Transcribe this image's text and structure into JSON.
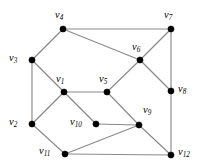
{
  "figure": {
    "background_color": "#ffffff",
    "edge_color": "#8a8a8a",
    "vertex_color": "#000000",
    "label_color": "#000000"
  },
  "graph": {
    "type": "undirected-graph",
    "vertex_count": 12,
    "edge_count": 18,
    "vertices": [
      {
        "id": "v1",
        "name": "v",
        "index": "1",
        "x": 64,
        "y": 92,
        "label_x": 56,
        "label_y": 74,
        "label_pos": "above-left"
      },
      {
        "id": "v2",
        "name": "v",
        "index": "2",
        "x": 32,
        "y": 124,
        "label_x": 9,
        "label_y": 117,
        "label_pos": "left"
      },
      {
        "id": "v3",
        "name": "v",
        "index": "3",
        "x": 32,
        "y": 60,
        "label_x": 9,
        "label_y": 53,
        "label_pos": "left"
      },
      {
        "id": "v4",
        "name": "v",
        "index": "4",
        "x": 63,
        "y": 29,
        "label_x": 55,
        "label_y": 10,
        "label_pos": "above"
      },
      {
        "id": "v5",
        "name": "v",
        "index": "5",
        "x": 107,
        "y": 92,
        "label_x": 99,
        "label_y": 74,
        "label_pos": "above-left"
      },
      {
        "id": "v6",
        "name": "v",
        "index": "6",
        "x": 140,
        "y": 60,
        "label_x": 132,
        "label_y": 42,
        "label_pos": "above-left"
      },
      {
        "id": "v7",
        "name": "v",
        "index": "7",
        "x": 171,
        "y": 29,
        "label_x": 164,
        "label_y": 10,
        "label_pos": "above"
      },
      {
        "id": "v8",
        "name": "v",
        "index": "8",
        "x": 171,
        "y": 91,
        "label_x": 178,
        "label_y": 84,
        "label_pos": "right"
      },
      {
        "id": "v9",
        "name": "v",
        "index": "9",
        "x": 139,
        "y": 125,
        "label_x": 143,
        "label_y": 105,
        "label_pos": "above-right"
      },
      {
        "id": "v10",
        "name": "v",
        "index": "10",
        "x": 96,
        "y": 124,
        "label_x": 70,
        "label_y": 117,
        "label_pos": "left"
      },
      {
        "id": "v11",
        "name": "v",
        "index": "11",
        "x": 65,
        "y": 154,
        "label_x": 39,
        "label_y": 146,
        "label_pos": "left"
      },
      {
        "id": "v12",
        "name": "v",
        "index": "12",
        "x": 171,
        "y": 155,
        "label_x": 178,
        "label_y": 147,
        "label_pos": "right"
      }
    ],
    "edges": [
      {
        "from": "v4",
        "to": "v7"
      },
      {
        "from": "v4",
        "to": "v3"
      },
      {
        "from": "v4",
        "to": "v6"
      },
      {
        "from": "v7",
        "to": "v6"
      },
      {
        "from": "v7",
        "to": "v8"
      },
      {
        "from": "v6",
        "to": "v5"
      },
      {
        "from": "v6",
        "to": "v8"
      },
      {
        "from": "v3",
        "to": "v2"
      },
      {
        "from": "v3",
        "to": "v1"
      },
      {
        "from": "v1",
        "to": "v5"
      },
      {
        "from": "v1",
        "to": "v2"
      },
      {
        "from": "v1",
        "to": "v10"
      },
      {
        "from": "v5",
        "to": "v9"
      },
      {
        "from": "v8",
        "to": "v12"
      },
      {
        "from": "v10",
        "to": "v9"
      },
      {
        "from": "v9",
        "to": "v11"
      },
      {
        "from": "v9",
        "to": "v12"
      },
      {
        "from": "v2",
        "to": "v11"
      },
      {
        "from": "v11",
        "to": "v12"
      }
    ]
  }
}
